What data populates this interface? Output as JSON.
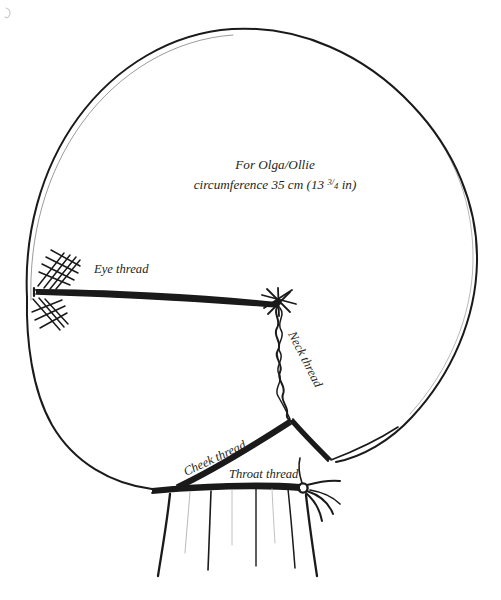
{
  "document": {
    "type": "hand-drawn sewing pattern diagram",
    "subject": "doll head thread-sculpting guide",
    "background_color": "#ffffff",
    "ink_color": "#1a1a1a",
    "width": 501,
    "height": 600
  },
  "annotation": {
    "title_line1": "For Olga/Ollie",
    "title_line2_prefix": "circumference 35 cm (13 ",
    "title_line2_fraction_numerator": "3",
    "title_line2_fraction_slash": "/",
    "title_line2_fraction_denominator": "4",
    "title_line2_suffix": " in)",
    "circumference_value": "35 cm",
    "circumference_imperial": "13 3/4 in",
    "doll_names": "Olga/Ollie"
  },
  "labels": {
    "eye_thread": "Eye thread",
    "neck_thread": "Neck thread",
    "cheek_thread": "Cheek thread",
    "throat_thread": "Throat thread"
  },
  "parts": {
    "head_outline": "head-outline",
    "eye_thread_line": "eye-thread-line",
    "neck_thread_line": "neck-thread-line",
    "cheek_thread_line": "cheek-thread-line",
    "throat_thread_line": "throat-thread-line",
    "stitch_patch_upper": "stitch-crosshatch-upper",
    "stitch_patch_lower": "stitch-crosshatch-lower",
    "knot_eye_neck": "knot-eye-neck-junction",
    "knot_throat": "knot-throat-tie-off",
    "neck_gathers": "neck-gather-lines",
    "corner_mark": "page-corner-mark"
  }
}
